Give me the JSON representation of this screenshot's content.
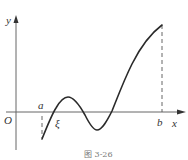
{
  "figure": {
    "caption": "图 3-26",
    "axes": {
      "x_label": "x",
      "y_label": "y",
      "origin_label": "O"
    },
    "points": {
      "a_label": "a",
      "b_label": "b",
      "xi_label": "ξ"
    },
    "colors": {
      "curve": "#2a2a2a",
      "axis": "#555555",
      "dashed": "#555555"
    }
  }
}
